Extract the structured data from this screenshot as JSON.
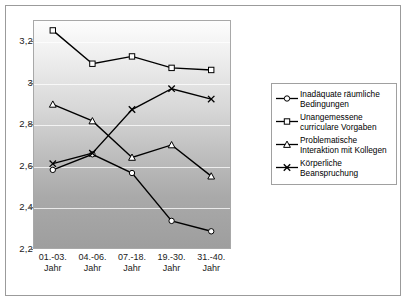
{
  "chart_data": {
    "type": "line",
    "title": "",
    "subtitle": "",
    "xlabel": "",
    "ylabel": "",
    "categories": [
      "01.-03.\nJahr",
      "04.-06.\nJahr",
      "07.-18.\nJahr",
      "19.-30.\nJahr",
      "31.-40.\nJahr"
    ],
    "category_lines": [
      [
        "01.-03.",
        "Jahr"
      ],
      [
        "04.-06.",
        "Jahr"
      ],
      [
        "07.-18.",
        "Jahr"
      ],
      [
        "19.-30.",
        "Jahr"
      ],
      [
        "31.-40.",
        "Jahr"
      ]
    ],
    "ylim": [
      2.2,
      3.3
    ],
    "yticks": [
      3.2,
      3.0,
      2.8,
      2.6,
      2.4,
      2.2
    ],
    "ytick_labels": [
      "3,2",
      "3",
      "2,8",
      "2,6",
      "2,4",
      "2,2"
    ],
    "grid": true,
    "grid_axis": "y",
    "legend_position": "right",
    "series": [
      {
        "name": "Inadäquate räumliche Bedingungen",
        "marker": "circle",
        "values": [
          2.58,
          2.655,
          2.565,
          2.335,
          2.285
        ]
      },
      {
        "name": "Unangemessene curriculare Vorgaben",
        "marker": "square",
        "values": [
          3.25,
          3.09,
          3.125,
          3.07,
          3.06
        ]
      },
      {
        "name": "Problematische Interaktion mit Kollegen",
        "marker": "triangle",
        "values": [
          2.895,
          2.815,
          2.64,
          2.7,
          2.55
        ]
      },
      {
        "name": "Körperliche Beanspruchung",
        "marker": "x",
        "values": [
          2.61,
          2.66,
          2.87,
          2.97,
          2.92
        ]
      }
    ],
    "colors": {
      "line": "#000000",
      "marker_fill": "#ffffff",
      "plot_bg_top": "#fdfdfd",
      "plot_bg_bottom": "#9e9e9e",
      "gridline": "#ffffff",
      "frame": "#9b9b9b"
    }
  },
  "legend": {
    "entries": [
      {
        "label": "Inadäquate räumliche Bedingungen",
        "marker": "circle"
      },
      {
        "label": "Unangemessene curriculare Vorgaben",
        "marker": "square"
      },
      {
        "label": "Problematische Interaktion mit Kollegen",
        "marker": "triangle"
      },
      {
        "label": "Körperliche Beanspruchung",
        "marker": "x"
      }
    ]
  }
}
